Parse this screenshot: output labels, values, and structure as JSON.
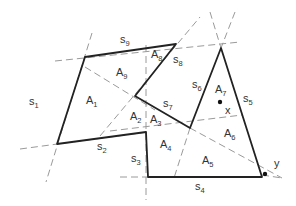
{
  "diagram": {
    "type": "polygon-partition",
    "colors": {
      "solid_edge": "#222222",
      "dashed_line": "#9a9a9a",
      "label": "#333333",
      "background": "#ffffff"
    },
    "side_labels": [
      {
        "id": "s1",
        "base": "s",
        "sub": "1"
      },
      {
        "id": "s2",
        "base": "s",
        "sub": "2"
      },
      {
        "id": "s3",
        "base": "s",
        "sub": "3"
      },
      {
        "id": "s4",
        "base": "s",
        "sub": "4"
      },
      {
        "id": "s5",
        "base": "s",
        "sub": "5"
      },
      {
        "id": "s6",
        "base": "s",
        "sub": "6"
      },
      {
        "id": "s7",
        "base": "s",
        "sub": "7"
      },
      {
        "id": "s8",
        "base": "s",
        "sub": "8"
      },
      {
        "id": "s9",
        "base": "s",
        "sub": "9"
      }
    ],
    "area_labels": [
      {
        "id": "A1",
        "base": "A",
        "sub": "1"
      },
      {
        "id": "A2",
        "base": "A",
        "sub": "2"
      },
      {
        "id": "A3",
        "base": "A",
        "sub": "3"
      },
      {
        "id": "A4",
        "base": "A",
        "sub": "4"
      },
      {
        "id": "A5",
        "base": "A",
        "sub": "5"
      },
      {
        "id": "A6",
        "base": "A",
        "sub": "6"
      },
      {
        "id": "A7",
        "base": "A",
        "sub": "7"
      },
      {
        "id": "A8",
        "base": "A",
        "sub": "8"
      },
      {
        "id": "A9",
        "base": "A",
        "sub": "9"
      }
    ],
    "points": [
      {
        "id": "x",
        "label": "x"
      },
      {
        "id": "y",
        "label": "y"
      }
    ]
  }
}
